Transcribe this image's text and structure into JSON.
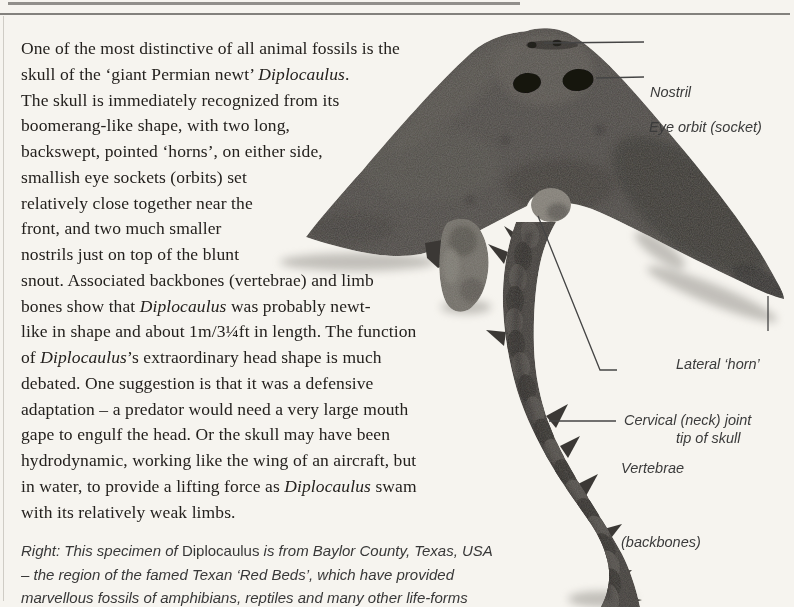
{
  "page": {
    "type": "book page about Diplocaulus fossil",
    "background_color": "#f6f4ef",
    "rule_color": "#83817d"
  },
  "body_text": {
    "lines": [
      [
        {
          "t": "One of the most distinctive of all animal fossils is the"
        }
      ],
      [
        {
          "t": "skull of the ‘giant Permian newt’ "
        },
        {
          "t": "Diplocaulus",
          "style": "italic"
        },
        {
          "t": "."
        }
      ],
      [
        {
          "t": "The skull is immediately recognized from its"
        }
      ],
      [
        {
          "t": "boomerang-like shape, with two long,"
        }
      ],
      [
        {
          "t": "backswept, pointed ‘horns’, on either side,"
        }
      ],
      [
        {
          "t": "smallish eye sockets (orbits) set"
        }
      ],
      [
        {
          "t": "relatively close together near the"
        }
      ],
      [
        {
          "t": "front, and two much smaller"
        }
      ],
      [
        {
          "t": "nostrils just on top of the blunt"
        }
      ],
      [
        {
          "t": "snout. Associated backbones (vertebrae) and limb"
        }
      ],
      [
        {
          "t": "bones show that "
        },
        {
          "t": "Diplocaulus",
          "style": "italic"
        },
        {
          "t": " was probably newt-"
        }
      ],
      [
        {
          "t": "like in shape and about 1m/3¼ft in length. The function"
        }
      ],
      [
        {
          "t": "of "
        },
        {
          "t": "Diplocaulus",
          "style": "italic"
        },
        {
          "t": "’s extraordinary head shape is much"
        }
      ],
      [
        {
          "t": "debated. One suggestion is that it was a defensive"
        }
      ],
      [
        {
          "t": "adaptation – a predator would need a very large mouth"
        }
      ],
      [
        {
          "t": "gape to engulf the head. Or the skull may have been"
        }
      ],
      [
        {
          "t": "hydrodynamic, working like the wing of an aircraft, but"
        }
      ],
      [
        {
          "t": "in water, to provide a lifting force as "
        },
        {
          "t": "Diplocaulus",
          "style": "italic"
        },
        {
          "t": " swam"
        }
      ],
      [
        {
          "t": "with its relatively weak limbs."
        }
      ]
    ]
  },
  "labels": {
    "nostril": {
      "text": "Nostril"
    },
    "eye_orbit": {
      "text": "Eye orbit (socket)"
    },
    "lateral_horn": {
      "line1": "Lateral ‘horn’",
      "line2": "tip of skull"
    },
    "cervical_joint": {
      "text": "Cervical (neck) joint"
    },
    "vertebrae": {
      "line1": "Vertebrae",
      "line2": "(backbones)"
    }
  },
  "caption": {
    "lines": [
      [
        {
          "t": "Right: This specimen of "
        },
        {
          "t": "Diplocaulus",
          "style": "roman"
        },
        {
          "t": " is from Baylor County, Texas, USA"
        }
      ],
      [
        {
          "t": "– the region of the famed Texan ‘Red Beds’, which have provided"
        }
      ],
      [
        {
          "t": "marvellous fossils of amphibians, reptiles and many other life-forms"
        }
      ]
    ]
  },
  "figure": {
    "kind": "photograph",
    "colors": {
      "fossil_dark": "#403d3a",
      "fossil_mid": "#4b4845",
      "fossil_light": "#74716a",
      "leader_line": "#454545"
    }
  }
}
